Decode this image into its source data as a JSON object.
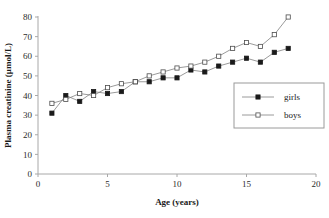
{
  "chart_data": {
    "type": "line",
    "title": "",
    "subtitle": "",
    "xlabel": "Age (years)",
    "ylabel": "Plasma creatinine  (µmol/L)",
    "xlim": [
      0,
      20
    ],
    "ylim": [
      0,
      80
    ],
    "xticks": [
      0,
      5,
      10,
      15,
      20
    ],
    "yticks": [
      0,
      10,
      20,
      30,
      40,
      50,
      60,
      70,
      80
    ],
    "xtick_labels": [
      "0",
      "5",
      "10",
      "15",
      "20"
    ],
    "ytick_labels": [
      "0",
      "10",
      "20",
      "30",
      "40",
      "50",
      "60",
      "70",
      "80"
    ],
    "grid": false,
    "legend_position": "center-right",
    "x": [
      1,
      2,
      3,
      4,
      5,
      6,
      7,
      8,
      9,
      10,
      11,
      12,
      13,
      14,
      15,
      16,
      17,
      18
    ],
    "series": [
      {
        "name": "girls",
        "marker": "filled-square",
        "color": "#000000",
        "line_color": "#808080",
        "values": [
          31,
          40,
          37,
          42,
          41,
          42,
          47,
          47,
          49,
          49,
          53,
          52,
          55,
          57,
          59,
          57,
          62,
          64
        ]
      },
      {
        "name": "boys",
        "marker": "open-square",
        "color": "#ffffff",
        "line_color": "#808080",
        "values": [
          36,
          38,
          41,
          40,
          44,
          46,
          47,
          50,
          52,
          54,
          55,
          57,
          60,
          64,
          67,
          65,
          71,
          80
        ]
      }
    ]
  },
  "legend": {
    "items": [
      {
        "label": "girls"
      },
      {
        "label": "boys"
      }
    ]
  },
  "axes": {
    "x_title": "Age (years)",
    "y_title": "Plasma creatinine  (µmol/L)"
  },
  "colors": {
    "axis": "#a8a8a8",
    "line": "#8c8c8c",
    "marker_fill": "#1a1a1a",
    "marker_edge": "#1a1a1a",
    "text": "#1a1a1a",
    "background": "#ffffff",
    "legend_border": "#9a9a9a"
  }
}
